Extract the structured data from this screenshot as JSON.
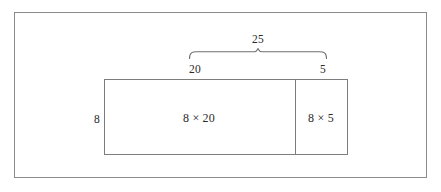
{
  "figure": {
    "type": "area-model-diagram",
    "brace": {
      "label": "25",
      "left_tip_x": 189,
      "right_tip_x": 327,
      "peak_x": 258
    },
    "segments": [
      {
        "name": "left-segment",
        "width_label": "20",
        "area_label": "8 × 20"
      },
      {
        "name": "right-segment",
        "width_label": "5",
        "area_label": "8 × 5"
      }
    ],
    "height_label": "8",
    "colors": {
      "frame_border": "#8a8a8a",
      "rect_border": "#7d7d7d",
      "brace_stroke": "#6f6f6f",
      "text": "#2a2a2a",
      "background": "#ffffff"
    }
  }
}
